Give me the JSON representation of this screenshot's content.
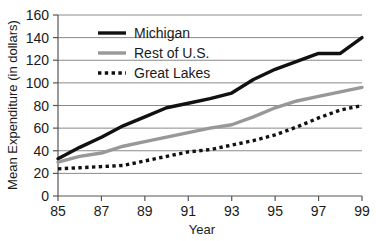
{
  "chart_data": {
    "type": "line",
    "title": "",
    "xlabel": "Year",
    "ylabel": "Mean Expenditure (in dollars)",
    "xlim": [
      85,
      99
    ],
    "ylim": [
      0,
      160
    ],
    "xticks": [
      "85",
      "87",
      "89",
      "91",
      "93",
      "95",
      "97",
      "99"
    ],
    "xtick_values": [
      85,
      87,
      89,
      91,
      93,
      95,
      97,
      99
    ],
    "yticks": [
      "0",
      "20",
      "40",
      "60",
      "80",
      "100",
      "120",
      "140",
      "160"
    ],
    "ytick_values": [
      0,
      20,
      40,
      60,
      80,
      100,
      120,
      140,
      160
    ],
    "grid": "horizontal",
    "legend_position": "upper-left-inside",
    "x": [
      85,
      86,
      87,
      88,
      89,
      90,
      91,
      92,
      93,
      94,
      95,
      96,
      97,
      98,
      99
    ],
    "series": [
      {
        "name": "Michigan",
        "style": "solid",
        "color": "#111111",
        "width": 3.4,
        "values": [
          33,
          43,
          52,
          62,
          70,
          78,
          82,
          86,
          91,
          103,
          112,
          119,
          126,
          126,
          140
        ]
      },
      {
        "name": "Rest of U.S.",
        "style": "solid",
        "color": "#989898",
        "width": 3.4,
        "values": [
          30,
          35,
          38,
          44,
          48,
          52,
          56,
          60,
          63,
          70,
          78,
          84,
          88,
          92,
          96
        ]
      },
      {
        "name": "Great Lakes",
        "style": "dotted",
        "color": "#111111",
        "width": 3.4,
        "values": [
          24,
          25,
          26,
          27,
          31,
          35,
          39,
          41,
          45,
          49,
          54,
          61,
          69,
          76,
          80
        ]
      }
    ]
  },
  "legend": {
    "items": [
      {
        "label": "Michigan"
      },
      {
        "label": "Rest of U.S."
      },
      {
        "label": "Great Lakes"
      }
    ]
  },
  "axes": {
    "x_title": "Year",
    "y_title": "Mean Expenditure (in dollars)"
  },
  "colors": {
    "michigan": "#111111",
    "rest_of_us": "#989898",
    "great_lakes": "#111111",
    "grid": "#8a8a8a",
    "axis": "#555555",
    "text": "#1a1a1a",
    "background": "#ffffff"
  }
}
